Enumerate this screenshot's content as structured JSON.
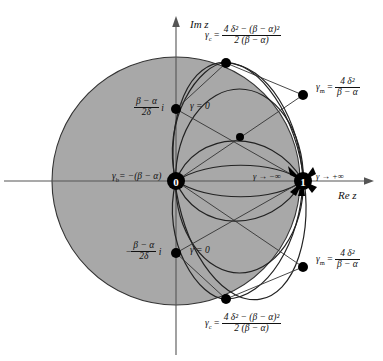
{
  "figure": {
    "axes": {
      "imaginary_axis_label": "Im z",
      "real_axis_label": "Re z"
    },
    "points": {
      "origin_label": "0",
      "unit_label": "1"
    },
    "labels": {
      "gamma_c_top": {
        "symbol": "γ",
        "subscript": "c",
        "equals": "=",
        "numerator": "4 δ² − (β − α)²",
        "denominator": "2 (β − α)"
      },
      "gamma_c_bottom": {
        "symbol": "γ",
        "subscript": "c",
        "equals": "=",
        "numerator": "4 δ² − (β − α)²",
        "denominator": "2 (β − α)"
      },
      "gamma_m_top": {
        "symbol": "γ",
        "subscript": "m",
        "equals": "=",
        "numerator": "4 δ²",
        "denominator": "β − α"
      },
      "gamma_m_bottom": {
        "symbol": "γ",
        "subscript": "m",
        "equals": "=",
        "numerator": "4 δ²",
        "denominator": "β − α"
      },
      "upper_imaginary_value": {
        "sign": "",
        "numerator": "β − α",
        "denominator": "2δ",
        "unit": "i"
      },
      "lower_imaginary_value": {
        "sign": "−",
        "numerator": "β − α",
        "denominator": "2δ",
        "unit": "i"
      },
      "gamma_zero_upper": "γ = 0",
      "gamma_zero_lower": "γ = 0",
      "gamma_b": "γ₆ = −(β − α)",
      "gamma_b_symbol": "γ",
      "gamma_b_sub": "b",
      "gamma_b_rhs": "= −(β − α)",
      "gamma_minus_infinity": "γ → −∞",
      "gamma_plus_infinity": "γ → +∞"
    },
    "colors": {
      "shaded_disk_fill": "#a8a8a8",
      "curve_stroke": "#1a1a1a",
      "axis_stroke": "#555555",
      "marker_fill": "#000000",
      "background": "#ffffff"
    },
    "geometry": {
      "origin_px": [
        176,
        181
      ],
      "unit_px": [
        303,
        181
      ],
      "big_circle_center_px": [
        176,
        181
      ],
      "big_circle_radius_px": 124,
      "upper_imag_point_px": [
        176,
        109
      ],
      "lower_imag_point_px": [
        176,
        253
      ],
      "gamma_c_point_top_px": [
        226,
        63
      ],
      "gamma_c_point_bottom_px": [
        226,
        299
      ],
      "gamma_m_point_top_px": [
        303,
        95
      ],
      "gamma_m_point_bottom_px": [
        303,
        267
      ],
      "crossing_point_px": [
        240,
        137
      ]
    }
  }
}
